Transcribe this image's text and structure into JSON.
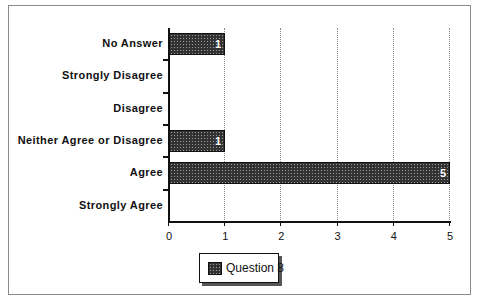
{
  "chart_data": {
    "type": "bar",
    "orientation": "horizontal",
    "title": "",
    "xlabel": "",
    "ylabel": "",
    "categories": [
      "No Answer",
      "Strongly Disagree",
      "Disagree",
      "Neither Agree or Disagree",
      "Agree",
      "Strongly Agree"
    ],
    "series": [
      {
        "name": "Question 8",
        "values": [
          1,
          0,
          0,
          1,
          5,
          0
        ]
      }
    ],
    "data_labels": [
      "1",
      "",
      "",
      "1",
      "5",
      ""
    ],
    "xlim": [
      0,
      5
    ],
    "xticks": [
      "0",
      "1",
      "2",
      "3",
      "4",
      "5"
    ],
    "grid": "vertical dotted",
    "legend_position": "bottom"
  },
  "legend": {
    "label": "Question 8"
  },
  "colors": {
    "bar_fill": "#333333",
    "bar_pattern": "#9a9a9a",
    "axis": "#111111",
    "frame": "#8a8a8a"
  }
}
